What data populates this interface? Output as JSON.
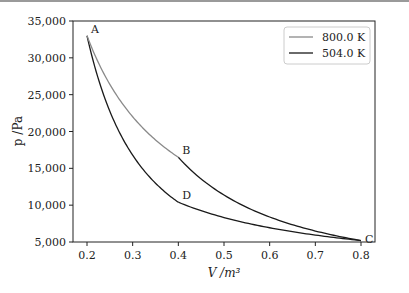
{
  "chart_data": {
    "type": "line",
    "title": "",
    "xlabel": "V /m³",
    "ylabel": "p /Pa",
    "xlim": [
      0.17,
      0.83
    ],
    "ylim": [
      5000,
      35000
    ],
    "x_ticks": [
      "0.2",
      "0.3",
      "0.4",
      "0.5",
      "0.6",
      "0.7",
      "0.8"
    ],
    "y_ticks": [
      "5,000",
      "10,000",
      "15,000",
      "20,000",
      "25,000",
      "30,000",
      "35,000"
    ],
    "grid": false,
    "legend_position": "upper right",
    "legend": [
      {
        "label": "800.0 K",
        "color": "#8a8a8a"
      },
      {
        "label": "504.0 K",
        "color": "#1a1a1a"
      }
    ],
    "points": [
      {
        "label": "A",
        "V": 0.2,
        "p": 33000
      },
      {
        "label": "B",
        "V": 0.4,
        "p": 16500
      },
      {
        "label": "C",
        "V": 0.8,
        "p": 5200
      },
      {
        "label": "D",
        "V": 0.4,
        "p": 10400
      }
    ],
    "series": [
      {
        "name": "800.0 K",
        "segment": "A-B isotherm",
        "color": "#8a8a8a",
        "pV": 6600,
        "V_range": [
          0.2,
          0.4
        ]
      },
      {
        "name": "504.0 K",
        "segment": "D-C isotherm",
        "color": "#1a1a1a",
        "pV": 4160,
        "V_range": [
          0.4,
          0.8
        ]
      },
      {
        "name": "adiabat A-D",
        "color": "#1a1a1a",
        "gamma": 1.667,
        "V_range": [
          0.2,
          0.4
        ]
      },
      {
        "name": "adiabat B-C",
        "color": "#1a1a1a",
        "gamma": 1.667,
        "V_range": [
          0.4,
          0.8
        ]
      }
    ]
  }
}
